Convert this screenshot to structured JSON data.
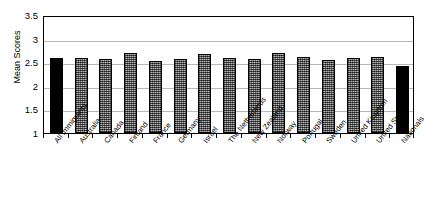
{
  "chart_data": {
    "type": "bar",
    "title": "",
    "xlabel": "",
    "ylabel": "Mean Scores",
    "ylim": [
      1,
      3.5
    ],
    "ytick_labels": [
      "3.5",
      "3",
      "2.5",
      "2",
      "1.5",
      "1"
    ],
    "ytick_values": [
      3.5,
      3,
      2.5,
      2,
      1.5,
      1
    ],
    "grid": true,
    "legend": "none",
    "categories": [
      "All Immigrants",
      "Australia",
      "Canada",
      "Finland",
      "France",
      "Germany",
      "Israel",
      "The Netherlands",
      "New Zealand",
      "Norway",
      "Portugal",
      "Sweden",
      "United Kingdom",
      "United States",
      "Nationals"
    ],
    "values": [
      2.58,
      2.58,
      2.57,
      2.69,
      2.52,
      2.56,
      2.68,
      2.59,
      2.56,
      2.7,
      2.6,
      2.55,
      2.59,
      2.62,
      2.42
    ],
    "bar_colors": [
      "black",
      "gray",
      "gray",
      "gray",
      "gray",
      "gray",
      "gray",
      "gray",
      "gray",
      "gray",
      "gray",
      "gray",
      "gray",
      "gray",
      "black"
    ]
  },
  "colors": {
    "bar_black": "#000000",
    "bar_gray": "#808080",
    "gridline": "#b9b9b9",
    "axis": "#000000",
    "background": "#ffffff"
  }
}
